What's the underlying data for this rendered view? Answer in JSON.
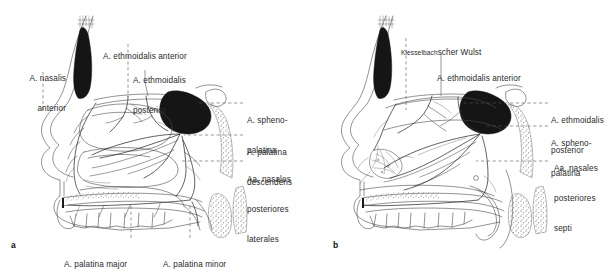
{
  "figure": {
    "type": "anatomical-illustration",
    "background_color": "#ffffff",
    "ink_color": "#2e2e2e",
    "sinus_fill": "#151515"
  },
  "panels": [
    {
      "id": "a",
      "id_label": "a",
      "subject": "lateral nasal wall",
      "labels": [
        {
          "name": "a-nasalis-anterior",
          "lines": [
            "A. nasalis",
            "anterior"
          ],
          "align": "right"
        },
        {
          "name": "a-ethmoidalis-anterior",
          "lines": [
            "A. ethmoidalis anterior"
          ],
          "align": "left"
        },
        {
          "name": "a-ethmoidalis-posterior",
          "lines": [
            "A. ethmoidalis",
            "posterior"
          ],
          "align": "left"
        },
        {
          "name": "a-sphenopalatina",
          "lines": [
            "A. spheno-",
            "palatina"
          ],
          "align": "left"
        },
        {
          "name": "a-palatina-descendens",
          "lines": [
            "A. palatina",
            "descendens"
          ],
          "align": "left"
        },
        {
          "name": "aa-nasales-posteriores-laterales",
          "lines": [
            "Aa. nasales",
            "posteriores",
            "laterales"
          ],
          "align": "left"
        },
        {
          "name": "a-palatina-major",
          "lines": [
            "A. palatina major"
          ],
          "align": "left"
        },
        {
          "name": "a-palatina-minor",
          "lines": [
            "A. palatina minor"
          ],
          "align": "left"
        }
      ]
    },
    {
      "id": "b",
      "id_label": "b",
      "subject": "nasal septum",
      "labels": [
        {
          "name": "kiesselbachscher-wulst",
          "small_caps_part": "Kiesselbach",
          "rest": "scher Wulst",
          "align": "left"
        },
        {
          "name": "b-ethmoidalis-anterior",
          "lines": [
            "A. ethmoidalis anterior"
          ],
          "align": "left"
        },
        {
          "name": "b-ethmoidalis-posterior",
          "lines": [
            "A. ethmoidalis",
            "posterior"
          ],
          "align": "left"
        },
        {
          "name": "b-sphenopalatina",
          "lines": [
            "A. spheno-",
            "palatina"
          ],
          "align": "left"
        },
        {
          "name": "aa-nasales-posteriores-septi",
          "lines": [
            "Aa. nasales",
            "posteriores",
            "septi"
          ],
          "align": "left"
        }
      ]
    }
  ],
  "text": {
    "a_nasalis_anterior_1": "A. nasalis",
    "a_nasalis_anterior_2": "anterior",
    "a_ethmoidalis_anterior": "A. ethmoidalis anterior",
    "a_ethmoidalis_posterior_1": "A. ethmoidalis",
    "a_ethmoidalis_posterior_2": "posterior",
    "a_sphenopalatina_1": "A. spheno-",
    "a_sphenopalatina_2": "palatina",
    "a_palatina_descendens_1": "A. palatina",
    "a_palatina_descendens_2": "descendens",
    "aa_nasales_lat_1": "Aa. nasales",
    "aa_nasales_lat_2": "posteriores",
    "aa_nasales_lat_3": "laterales",
    "a_palatina_major": "A. palatina major",
    "a_palatina_minor": "A. palatina minor",
    "panel_a_id": "a",
    "kiesselbach_sc": "Kiesselbach",
    "kiesselbach_rest": "scher Wulst",
    "b_ethmoidalis_anterior": "A. ethmoidalis anterior",
    "b_ethmoidalis_posterior_1": "A. ethmoidalis",
    "b_ethmoidalis_posterior_2": "posterior",
    "b_sphenopalatina_1": "A. spheno-",
    "b_sphenopalatina_2": "palatina",
    "aa_nasales_septi_1": "Aa. nasales",
    "aa_nasales_septi_2": "posteriores",
    "aa_nasales_septi_3": "septi",
    "panel_b_id": "b"
  }
}
